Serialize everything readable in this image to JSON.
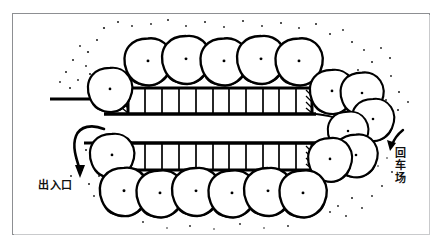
{
  "image": {
    "kind": "hand-drawn-site-plan",
    "title": "Parking lot layout plan",
    "background_color": "#ffffff",
    "ink_color": "#000000",
    "frame_color": "#8d8f92"
  },
  "labels": {
    "entrance": "出入口",
    "turnaround": "回车场"
  },
  "annotations": [
    {
      "name": "entrance-arrow",
      "description": "curved arrow hooking left then pointing down toward the entrance drive",
      "points_to": "出入口"
    },
    {
      "name": "turnaround-arrow",
      "description": "short curved arrow pointing down-left toward the vehicle turning bay",
      "points_to": "回车场"
    }
  ],
  "plan": {
    "parking_rows": [
      {
        "name": "upper-parking-row",
        "stall_count": 11,
        "tree_row_position": "above",
        "tree_count": 5
      },
      {
        "name": "lower-parking-row",
        "stall_count": 11,
        "tree_row_position": "below",
        "tree_count": 6
      }
    ],
    "drive_aisle": {
      "name": "central-drive-aisle",
      "orientation": "horizontal"
    },
    "turnaround_bay": {
      "name": "vehicle-turnaround",
      "position": "right-end"
    },
    "entrance_drive": {
      "name": "entrance-drive",
      "position": "left-end"
    },
    "trees": {
      "left_cluster_count": 2,
      "right_cluster_count": 5,
      "style": "blob canopy with heavy shadow on lower-right and a small center dot"
    }
  }
}
